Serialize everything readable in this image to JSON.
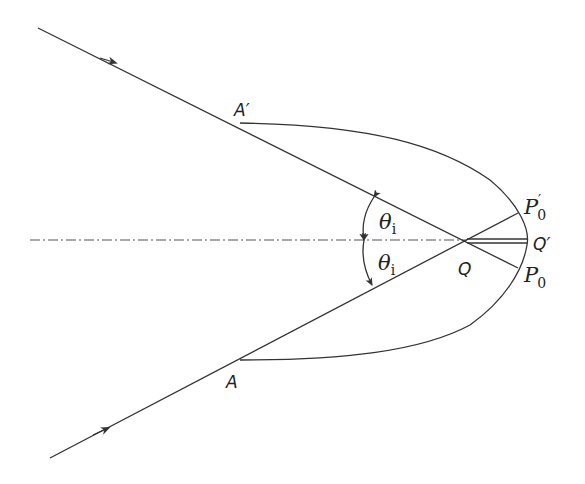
{
  "diagram": {
    "type": "ray-optics-focusing",
    "labels": {
      "A_prime": "A′",
      "A": "A",
      "theta_upper": "θ",
      "theta_upper_sub": "i",
      "theta_lower": "θ",
      "theta_lower_sub": "i",
      "Q": "Q",
      "Q_prime": "Q′",
      "P0_prime": "P",
      "P0_prime_sub": "0",
      "P0_prime_mark": "′",
      "P0": "P",
      "P0_sub": "0"
    },
    "elements": [
      "upper-incident-ray",
      "lower-incident-ray",
      "optical-axis",
      "wavefront-curve",
      "angle-arc-upper",
      "angle-arc-lower",
      "Q-Qprime-double-line"
    ],
    "colors": {
      "line": "#333333",
      "background": "#ffffff"
    }
  }
}
